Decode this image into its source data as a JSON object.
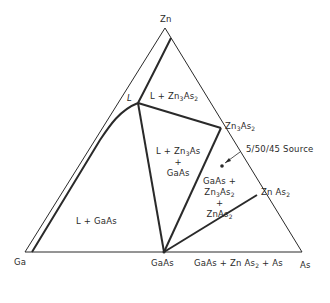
{
  "vertices": {
    "top": "Zn",
    "left": "Ga",
    "right": "As"
  },
  "compounds": {
    "gaas": "GaAs",
    "zn3as2": {
      "base": "Zn",
      "n1": "3",
      "mid": "As",
      "n2": "2"
    },
    "znas2": {
      "base": "Zn As",
      "n2": "2"
    }
  },
  "points": {
    "liquid": "L",
    "source": "5/50/45 Source"
  },
  "regions": {
    "l_zn3as2": {
      "prefix": "L + Zn",
      "n1": "3",
      "mid": "As",
      "n2": "2"
    },
    "l_zn3as_gaas": {
      "line1_prefix": "L + Zn",
      "n1": "3",
      "line1_suffix": "As",
      "plus": "+",
      "line3": "GaAs"
    },
    "l_gaas": "L + GaAs",
    "gaas_zn3as2_znas2": {
      "line1": "GaAs +",
      "line2_prefix": "Zn",
      "n1": "3",
      "line2_mid": "As",
      "n2": "2",
      "plus": "+",
      "line4_prefix": "ZnAs",
      "n3": "2"
    },
    "gaas_znas2_as": {
      "prefix": "GaAs + Zn As",
      "n2": "2",
      "suffix": " + As"
    }
  },
  "colors": {
    "line": "#2a2a2a",
    "background": "#ffffff"
  }
}
